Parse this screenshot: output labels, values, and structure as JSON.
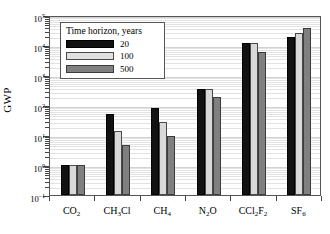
{
  "chart_data": {
    "type": "bar",
    "title": "",
    "xlabel": "",
    "ylabel": "GWP",
    "yscale": "log",
    "ylim": [
      0.1,
      100000
    ],
    "ytick_labels": [
      "10-1",
      "100",
      "101",
      "102",
      "103",
      "104",
      "105"
    ],
    "grid": true,
    "legend_position": "upper-left",
    "categories": [
      "CO2",
      "CH3Cl",
      "CH4",
      "N2O",
      "CCl2F2",
      "SF6"
    ],
    "series": [
      {
        "name": "20",
        "values": [
          1,
          50,
          80,
          330,
          12000,
          19000
        ]
      },
      {
        "name": "100",
        "values": [
          1,
          14,
          28,
          330,
          12000,
          26000
        ]
      },
      {
        "name": "500",
        "values": [
          1,
          4.5,
          9,
          180,
          6000,
          38000
        ]
      }
    ]
  },
  "axis": {
    "y_title": "GWP",
    "y_ticks": [
      {
        "mantissa": "10",
        "exponent": "5",
        "value": 100000
      },
      {
        "mantissa": "10",
        "exponent": "4",
        "value": 10000
      },
      {
        "mantissa": "10",
        "exponent": "3",
        "value": 1000
      },
      {
        "mantissa": "10",
        "exponent": "2",
        "value": 100
      },
      {
        "mantissa": "10",
        "exponent": "1",
        "value": 10
      },
      {
        "mantissa": "10",
        "exponent": "0",
        "value": 1
      },
      {
        "mantissa": "10",
        "exponent": "–1",
        "value": 0.1
      }
    ],
    "x_categories": [
      {
        "pre": "CO",
        "sub1": "2",
        "mid": "",
        "sub2": "",
        "post": ""
      },
      {
        "pre": "CH",
        "sub1": "3",
        "mid": "Cl",
        "sub2": "",
        "post": ""
      },
      {
        "pre": "CH",
        "sub1": "4",
        "mid": "",
        "sub2": "",
        "post": ""
      },
      {
        "pre": "N",
        "sub1": "2",
        "mid": "O",
        "sub2": "",
        "post": ""
      },
      {
        "pre": "CCl",
        "sub1": "2",
        "mid": "F",
        "sub2": "2",
        "post": ""
      },
      {
        "pre": "SF",
        "sub1": "6",
        "mid": "",
        "sub2": "",
        "post": ""
      }
    ]
  },
  "legend": {
    "title": "Time horizon, years",
    "entries": [
      {
        "label": "20",
        "color": "#121212"
      },
      {
        "label": "100",
        "color": "#e0e0e0"
      },
      {
        "label": "500",
        "color": "#808080"
      }
    ]
  }
}
